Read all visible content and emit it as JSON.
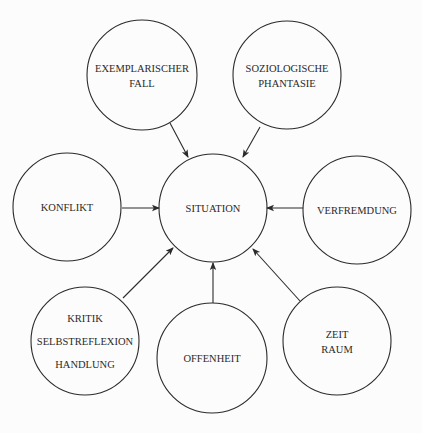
{
  "header": {
    "cutoff_text": ""
  },
  "colors": {
    "background": "#fcfcfc",
    "stroke": "#2b2b2b",
    "text": "#2a2a2a"
  },
  "diagram": {
    "center": {
      "id": "situation",
      "lines": [
        "SITUATION"
      ],
      "cx": 213,
      "cy": 208,
      "r": 54
    },
    "nodes": [
      {
        "id": "exemplarischer-fall",
        "lines": [
          "EXEMPLARISCHER",
          "FALL"
        ],
        "cx": 142,
        "cy": 75,
        "r": 55
      },
      {
        "id": "soziologische-phantasie",
        "lines": [
          "SOZIOLOGISCHE",
          "PHANTASIE"
        ],
        "cx": 287,
        "cy": 75,
        "r": 54
      },
      {
        "id": "konflikt",
        "lines": [
          "KONFLIKT"
        ],
        "cx": 67,
        "cy": 207,
        "r": 54
      },
      {
        "id": "verfremdung",
        "lines": [
          "VERFREMDUNG"
        ],
        "cx": 357,
        "cy": 210,
        "r": 54
      },
      {
        "id": "kritik-selbstreflexion-handlung",
        "lines": [
          "KRITIK",
          "SELBSTREFLEXION",
          "HANDLUNG"
        ],
        "cx": 85,
        "cy": 341,
        "r": 54
      },
      {
        "id": "offenheit",
        "lines": [
          "OFFENHEIT"
        ],
        "cx": 212,
        "cy": 358,
        "r": 55
      },
      {
        "id": "zeit-raum",
        "lines": [
          "ZEIT",
          "RAUM"
        ],
        "cx": 337,
        "cy": 341,
        "r": 54
      }
    ],
    "edges": [
      {
        "from": "exemplarischer-fall",
        "to": "situation",
        "x1": 170,
        "y1": 123,
        "x2": 188,
        "y2": 157
      },
      {
        "from": "soziologische-phantasie",
        "to": "situation",
        "x1": 260,
        "y1": 127,
        "x2": 243,
        "y2": 157
      },
      {
        "from": "konflikt",
        "to": "situation",
        "x1": 122,
        "y1": 208,
        "x2": 159,
        "y2": 208
      },
      {
        "from": "verfremdung",
        "to": "situation",
        "x1": 303,
        "y1": 208,
        "x2": 267,
        "y2": 208
      },
      {
        "from": "kritik-selbstreflexion-handlung",
        "to": "situation",
        "x1": 123,
        "y1": 298,
        "x2": 173,
        "y2": 248
      },
      {
        "from": "offenheit",
        "to": "situation",
        "x1": 213,
        "y1": 303,
        "x2": 213,
        "y2": 263
      },
      {
        "from": "zeit-raum",
        "to": "situation",
        "x1": 300,
        "y1": 301,
        "x2": 253,
        "y2": 249
      }
    ]
  }
}
